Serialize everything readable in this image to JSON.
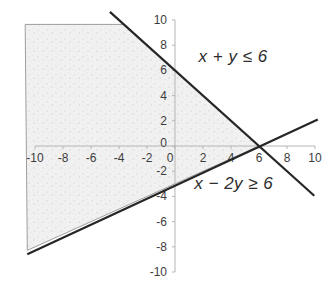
{
  "window": {
    "width": 332,
    "height": 300,
    "background": "#ffffff"
  },
  "chart_data": {
    "type": "line",
    "title": "",
    "xlabel": "",
    "ylabel": "",
    "xlim": [
      -10,
      10
    ],
    "ylim": [
      -10,
      10
    ],
    "grid": false,
    "legend": "none",
    "x_ticks": [
      -10,
      -8,
      -6,
      -4,
      -2,
      0,
      2,
      4,
      6,
      8,
      10
    ],
    "y_ticks": [
      -10,
      -8,
      -6,
      -4,
      -2,
      0,
      2,
      4,
      6,
      8,
      10
    ],
    "series": [
      {
        "name": "boundary x + y = 6",
        "equation": "y = 6 − x",
        "points": [
          [
            -4.65,
            10.65
          ],
          [
            9.95,
            -3.95
          ]
        ]
      },
      {
        "name": "boundary x − 2y = 6",
        "equation": "y = (x − 6) / 2",
        "points": [
          [
            -10.55,
            -8.6
          ],
          [
            10.2,
            2.1
          ]
        ]
      }
    ],
    "intersection_point": [
      6,
      0
    ],
    "shaded_region": {
      "description": "feasible region satisfying x + y ≤ 6 and x − 2y ≥ 6, clipped to the plot window",
      "vertices": [
        [
          -10.7,
          9.65
        ],
        [
          -3.65,
          9.65
        ],
        [
          6,
          0
        ],
        [
          -10.55,
          -8.28
        ]
      ]
    },
    "annotations": [
      {
        "text": "x + y ≤ 6",
        "x": 4.15,
        "y": 7.1
      },
      {
        "text": "x − 2y ≥ 6",
        "x": 4.2,
        "y": -3.0
      }
    ],
    "colors": {
      "line": "#262626",
      "axis": "#b5b5b5",
      "tick_label": "#3d3d3d",
      "region_border": "#9e9e9e",
      "region_fill": "#f1f1f1",
      "annotation_text": "#2e2e2e",
      "background": "#ffffff"
    }
  }
}
